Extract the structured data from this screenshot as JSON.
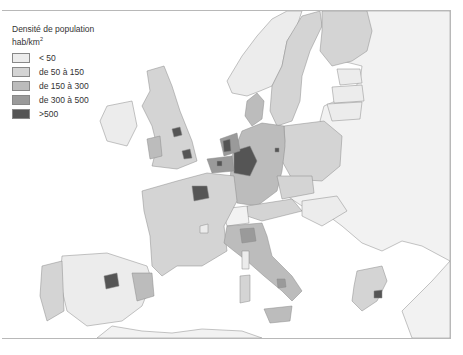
{
  "legend": {
    "title": "Densité de population",
    "unit_base": "hab/km",
    "unit_exp": "2",
    "classes": [
      {
        "label": "< 50",
        "color": "#ececec"
      },
      {
        "label": "de 50 à 150",
        "color": "#d4d4d4"
      },
      {
        "label": "de 150 à 300",
        "color": "#bcbcbc"
      },
      {
        "label": "de 300 à 500",
        "color": "#9a9a9a"
      },
      {
        "label": ">500",
        "color": "#555555"
      }
    ]
  },
  "colors": {
    "sea": "#ffffff",
    "border": "#8a8a8a",
    "non_member": "#f2f2f2"
  }
}
